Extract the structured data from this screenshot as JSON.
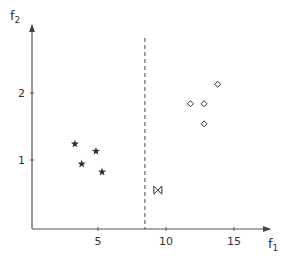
{
  "chart_data": {
    "type": "scatter",
    "title": "",
    "xlabel": "f",
    "xlabel_sub": "1",
    "ylabel": "f",
    "ylabel_sub": "2",
    "xlim": [
      0,
      17.5
    ],
    "ylim": [
      0,
      3
    ],
    "grid": false,
    "legend": null,
    "x_ticks": [
      {
        "value": 5,
        "label": "5"
      },
      {
        "value": 10,
        "label": "10"
      },
      {
        "value": 15,
        "label": "15"
      }
    ],
    "y_ticks": [
      {
        "value": 1,
        "label": "1"
      },
      {
        "value": 2,
        "label": "2"
      }
    ],
    "series": [
      {
        "name": "class-star",
        "marker": "star",
        "points": [
          {
            "x": 3.3,
            "y": 1.24
          },
          {
            "x": 4.85,
            "y": 1.13
          },
          {
            "x": 3.8,
            "y": 0.94
          },
          {
            "x": 5.3,
            "y": 0.82
          }
        ]
      },
      {
        "name": "class-diamond",
        "marker": "diamond",
        "points": [
          {
            "x": 13.8,
            "y": 2.13
          },
          {
            "x": 11.8,
            "y": 1.84
          },
          {
            "x": 12.8,
            "y": 1.84
          },
          {
            "x": 12.8,
            "y": 1.54
          }
        ]
      },
      {
        "name": "query-point",
        "marker": "bowtie",
        "points": [
          {
            "x": 9.4,
            "y": 0.55
          }
        ]
      }
    ],
    "annotations": [
      {
        "type": "vertical-dashed-line",
        "x": 8.45,
        "description": "decision boundary"
      }
    ]
  },
  "glyphs": {
    "star": "★",
    "diamond": "◇",
    "bowtie": "⋈"
  },
  "colors": {
    "axis": "#555555",
    "marker": "#333333",
    "dashed": "#444444"
  }
}
